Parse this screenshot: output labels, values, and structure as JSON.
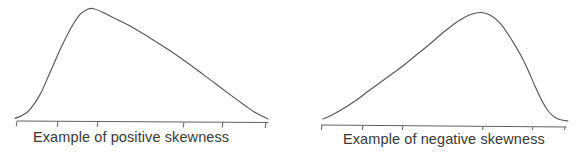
{
  "figure": {
    "background": "#ffffff",
    "curve_color": "#565656",
    "axis_color": "#606060",
    "text_color": "#383838"
  },
  "chart_data": [
    {
      "type": "line",
      "title": "Example of positive skewness",
      "skew": "positive",
      "xlabel": "",
      "ylabel": "",
      "grid": false,
      "legend": false,
      "axis_tick_labels": [],
      "ylim": [
        0,
        1
      ],
      "peak_position_frac": 0.31,
      "x_frac": [
        0.0,
        0.028,
        0.059,
        0.099,
        0.138,
        0.178,
        0.217,
        0.257,
        0.289,
        0.308,
        0.344,
        0.383,
        0.455,
        0.534,
        0.613,
        0.692,
        0.771,
        0.85,
        0.909,
        0.949,
        0.985,
        1.0
      ],
      "y_frac": [
        0.01,
        0.036,
        0.09,
        0.224,
        0.421,
        0.628,
        0.807,
        0.946,
        0.995,
        1.0,
        0.969,
        0.924,
        0.843,
        0.735,
        0.619,
        0.493,
        0.359,
        0.224,
        0.126,
        0.063,
        0.022,
        0.005
      ],
      "axis_ticks_frac": [
        0.008,
        0.17,
        0.328,
        0.668,
        0.822,
        0.992
      ]
    },
    {
      "type": "line",
      "title": "Example of negative skewness",
      "skew": "negative",
      "xlabel": "",
      "ylabel": "",
      "grid": false,
      "legend": false,
      "axis_tick_labels": [],
      "ylim": [
        0,
        1
      ],
      "peak_position_frac": 0.65,
      "x_frac": [
        0.008,
        0.036,
        0.081,
        0.138,
        0.198,
        0.259,
        0.32,
        0.381,
        0.441,
        0.502,
        0.563,
        0.611,
        0.648,
        0.684,
        0.725,
        0.765,
        0.806,
        0.838,
        0.866,
        0.895,
        0.923,
        0.951,
        0.976,
        1.0
      ],
      "y_frac": [
        0.018,
        0.046,
        0.101,
        0.184,
        0.286,
        0.387,
        0.488,
        0.599,
        0.71,
        0.829,
        0.931,
        0.986,
        1.0,
        0.977,
        0.903,
        0.774,
        0.618,
        0.47,
        0.323,
        0.184,
        0.083,
        0.028,
        0.009,
        0.0
      ],
      "axis_ticks_frac": [
        0.004,
        0.17,
        0.332,
        0.656,
        0.858,
        0.988
      ]
    }
  ]
}
